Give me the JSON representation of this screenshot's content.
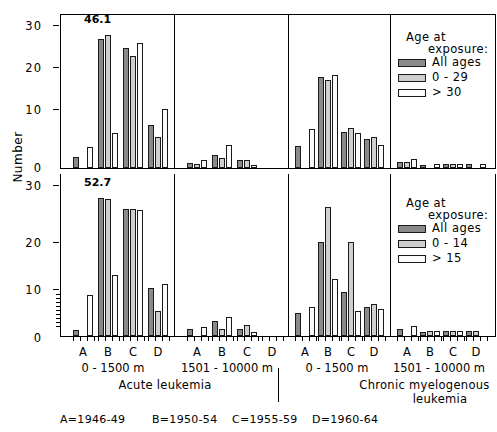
{
  "axis": {
    "y_label": "Number",
    "y_ticks_top": [
      "30",
      "20",
      "10",
      "0"
    ],
    "y_ticks_bottom": [
      "30",
      "20",
      "10",
      "0"
    ],
    "y_max": 32,
    "x_letters": [
      "A",
      "B",
      "C",
      "D"
    ],
    "distance_labels": [
      "0 - 1500 m",
      "1501 - 10000 m",
      "0 - 1500 m",
      "1501 - 10000 m"
    ]
  },
  "group_labels": {
    "acute": "Acute  leukemia",
    "chronic_line1": "Chronic  myelogenous",
    "chronic_line2": "leukemia"
  },
  "period_key": {
    "a": "A=1946-49",
    "b": "B=1950-54",
    "c": "C=1955-59",
    "d": "D=1960-64"
  },
  "legend_top": {
    "title_line1": "Age  at",
    "title_line2": "exposure:",
    "entries": [
      {
        "label": "All ages",
        "color": "#8a8a8a"
      },
      {
        "label": "0  -   29",
        "color": "#cfcfcf"
      },
      {
        "label": ">  30",
        "color": "#fbfbfb"
      }
    ]
  },
  "legend_bottom": {
    "title_line1": "Age  at",
    "title_line2": "exposure:",
    "entries": [
      {
        "label": "All ages",
        "color": "#8a8a8a"
      },
      {
        "label": "0  -  14",
        "color": "#cfcfcf"
      },
      {
        "label": ">  15",
        "color": "#fbfbfb"
      }
    ]
  },
  "annotations": {
    "top": "46.1",
    "bottom": "52.7"
  },
  "chart_data": {
    "type": "bar",
    "xlabel": "",
    "ylabel": "Number",
    "ylim": [
      0,
      32
    ],
    "grid": false,
    "legend_position": "right",
    "categories": [
      "A=1946-49",
      "B=1950-54",
      "C=1955-59",
      "D=1960-64"
    ],
    "panels": [
      {
        "row": "top",
        "disease": "Acute leukemia",
        "distance": "0 - 1500 m",
        "legend": "Age at exposure (All ages / 0-29 / >30)",
        "annotation": "46.1",
        "series": [
          {
            "name": "All ages",
            "values": [
              2.5,
              29.0,
              27.0,
              9.6
            ]
          },
          {
            "name": "0 - 29",
            "values": [
              0.0,
              30.0,
              25.3,
              7.0
            ]
          },
          {
            "name": "> 30",
            "values": [
              4.8,
              7.8,
              28.2,
              13.2
            ]
          }
        ]
      },
      {
        "row": "top",
        "disease": "Acute leukemia",
        "distance": "1501 - 10000 m",
        "legend": "Age at exposure (All ages / 0-29 / >30)",
        "annotation": "",
        "series": [
          {
            "name": "All ages",
            "values": [
              1.1,
              3.0,
              1.9,
              0.0
            ]
          },
          {
            "name": "0 - 29",
            "values": [
              0.8,
              2.3,
              1.8,
              0.0
            ]
          },
          {
            "name": "> 30",
            "values": [
              1.8,
              5.1,
              0.7,
              0.0
            ]
          }
        ]
      },
      {
        "row": "top",
        "disease": "Chronic myelogenous leukemia",
        "distance": "0 - 1500 m",
        "legend": "Age at exposure (All ages / 0-29 / >30)",
        "annotation": "",
        "series": [
          {
            "name": "All ages",
            "values": [
              4.9,
              20.4,
              8.2,
              6.6
            ]
          },
          {
            "name": "0 - 29",
            "values": [
              0.0,
              19.8,
              9.0,
              7.0
            ]
          },
          {
            "name": "> 30",
            "values": [
              8.7,
              21.0,
              7.8,
              5.1
            ]
          }
        ]
      },
      {
        "row": "top",
        "disease": "Chronic myelogenous leukemia",
        "distance": "1501 - 10000 m",
        "legend": "Age at exposure (All ages / 0-29 / >30)",
        "annotation": "",
        "series": [
          {
            "name": "All ages",
            "values": [
              1.4,
              0.7,
              0.9,
              0.8
            ]
          },
          {
            "name": "0 - 29",
            "values": [
              1.3,
              0.0,
              0.9,
              0.0
            ]
          },
          {
            "name": "> 30",
            "values": [
              2.0,
              0.9,
              0.9,
              0.9
            ]
          }
        ]
      },
      {
        "row": "bottom",
        "disease": "Acute leukemia",
        "distance": "0 - 1500 m",
        "legend": "Age at exposure (All ages / 0-14 / >15)",
        "annotation": "52.7",
        "series": [
          {
            "name": "All ages",
            "values": [
              1.2,
              29.5,
              27.0,
              10.3
            ]
          },
          {
            "name": "0 - 14",
            "values": [
              0.0,
              29.3,
              27.2,
              5.3
            ]
          },
          {
            "name": "> 15",
            "values": [
              8.8,
              13.0,
              26.8,
              11.2
            ]
          }
        ]
      },
      {
        "row": "bottom",
        "disease": "Acute leukemia",
        "distance": "1501 - 10000 m",
        "legend": "Age at exposure (All ages / 0-14 / >15)",
        "annotation": "",
        "series": [
          {
            "name": "All ages",
            "values": [
              1.4,
              3.1,
              1.6,
              0.0
            ]
          },
          {
            "name": "0 - 14",
            "values": [
              0.0,
              1.6,
              2.4,
              0.0
            ]
          },
          {
            "name": "> 15",
            "values": [
              1.9,
              4.0,
              0.9,
              0.0
            ]
          }
        ]
      },
      {
        "row": "bottom",
        "disease": "Chronic myelogenous leukemia",
        "distance": "0 - 1500 m",
        "legend": "Age at exposure (All ages / 0-14 / >15)",
        "annotation": "",
        "series": [
          {
            "name": "All ages",
            "values": [
              4.9,
              20.1,
              9.3,
              6.2
            ]
          },
          {
            "name": "0 - 14",
            "values": [
              0.0,
              27.6,
              20.0,
              6.8
            ]
          },
          {
            "name": "> 15",
            "values": [
              6.1,
              12.1,
              5.4,
              5.8
            ]
          }
        ]
      },
      {
        "row": "bottom",
        "disease": "Chronic myelogenous leukemia",
        "distance": "1501 - 10000 m",
        "legend": "Age at exposure (All ages / 0-14 / >15)",
        "annotation": "",
        "series": [
          {
            "name": "All ages",
            "values": [
              1.4,
              0.9,
              1.0,
              1.0
            ]
          },
          {
            "name": "0 - 14",
            "values": [
              0.0,
              1.0,
              1.1,
              1.0
            ]
          },
          {
            "name": "> 15",
            "values": [
              2.2,
              1.0,
              1.0,
              0.0
            ]
          }
        ]
      }
    ]
  }
}
